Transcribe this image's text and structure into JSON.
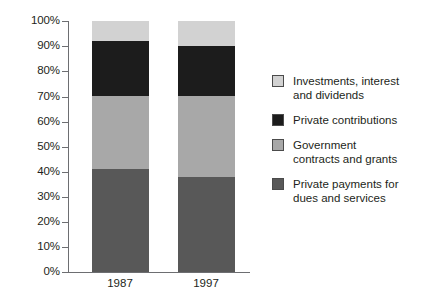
{
  "chart_data": {
    "type": "bar",
    "title": "",
    "subtitle": "",
    "xlabel": "",
    "ylabel": "",
    "stacked": true,
    "stack_total": 100,
    "unit": "%",
    "ylim": [
      0,
      100
    ],
    "grid": false,
    "legend_position": "right",
    "categories": [
      "1987",
      "1997"
    ],
    "ytick_labels": [
      "100%",
      "90%",
      "80%",
      "70%",
      "60%",
      "50%",
      "40%",
      "30%",
      "20%",
      "10%",
      "0%"
    ],
    "ytick_values": [
      100,
      90,
      80,
      70,
      60,
      50,
      40,
      30,
      20,
      10,
      0
    ],
    "series": [
      {
        "name": "Investments, interest\nand dividends",
        "color": "#d2d2d2",
        "values": [
          8,
          10
        ]
      },
      {
        "name": "Private contributions",
        "color": "#1c1c1c",
        "values": [
          22,
          20
        ]
      },
      {
        "name": "Government\ncontracts and grants",
        "color": "#a8a8a8",
        "values": [
          29,
          32
        ]
      },
      {
        "name": "Private payments for\ndues and services",
        "color": "#585858",
        "values": [
          41,
          38
        ]
      }
    ],
    "cumulative_boundaries": {
      "1987": [
        41,
        70,
        92,
        100
      ],
      "1997": [
        38,
        70,
        90,
        100
      ]
    }
  },
  "axis": {
    "tick_0": "100%",
    "tick_1": "90%",
    "tick_2": "80%",
    "tick_3": "70%",
    "tick_4": "60%",
    "tick_5": "50%",
    "tick_6": "40%",
    "tick_7": "30%",
    "tick_8": "20%",
    "tick_9": "10%",
    "tick_10": "0%",
    "cat_0": "1987",
    "cat_1": "1997"
  },
  "legend": {
    "items": [
      {
        "label": "Investments, interest\nand dividends",
        "color": "#d2d2d2"
      },
      {
        "label": "Private contributions",
        "color": "#1c1c1c"
      },
      {
        "label": "Government\ncontracts and grants",
        "color": "#a8a8a8"
      },
      {
        "label": "Private payments for\ndues and services",
        "color": "#585858"
      }
    ]
  }
}
